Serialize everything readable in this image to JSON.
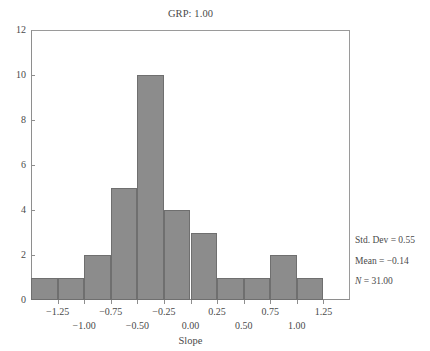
{
  "chart_data": {
    "type": "bar",
    "title": "GRP: 1.00",
    "xlabel": "Slope",
    "ylabel": "",
    "grid": false,
    "legend": "none",
    "bin_width": 0.25,
    "xlim": [
      -1.5,
      1.5
    ],
    "ylim": [
      0,
      12
    ],
    "categories": [
      "-1.50 to -1.25",
      "-1.25 to -1.00",
      "-1.00 to -0.75",
      "-0.75 to -0.50",
      "-0.50 to -0.25",
      "-0.25 to 0.00",
      "0.00 to 0.25",
      "0.25 to 0.50",
      "0.50 to 0.75",
      "0.75 to 1.00",
      "1.00 to 1.25",
      "1.25 to 1.50"
    ],
    "bin_centers": [
      -1.375,
      -1.125,
      -0.875,
      -0.625,
      -0.375,
      -0.125,
      0.125,
      0.375,
      0.625,
      0.875,
      1.125,
      1.375
    ],
    "values": [
      1,
      1,
      2,
      5,
      10,
      4,
      3,
      1,
      1,
      2,
      1,
      0
    ],
    "x_ticks_upper": [
      "-1.25",
      "-0.75",
      "-0.25",
      "0.25",
      "0.75",
      "1.25"
    ],
    "x_ticks_upper_values": [
      -1.25,
      -0.75,
      -0.25,
      0.25,
      0.75,
      1.25
    ],
    "x_ticks_lower": [
      "-1.00",
      "-0.50",
      "0.00",
      "0.50",
      "1.00"
    ],
    "x_ticks_lower_values": [
      -1.0,
      -0.5,
      0.0,
      0.5,
      1.0
    ],
    "y_ticks": [
      "0",
      "2",
      "4",
      "6",
      "8",
      "10",
      "12"
    ],
    "y_tick_values": [
      0,
      2,
      4,
      6,
      8,
      10,
      12
    ],
    "bar_color": "#8c8c8c",
    "bar_edge_color": "#6f6f6f",
    "axis_color": "#8e8e8e",
    "text_color": "#4a4a4a"
  },
  "title": {
    "text": "GRP: 1.00"
  },
  "axes": {
    "x_title": "Slope"
  },
  "stats": {
    "std_dev_label": "Std. Dev = 0.55",
    "mean_label": "Mean = −0.14",
    "n_symbol": "N",
    "n_value": " = 31.00"
  }
}
